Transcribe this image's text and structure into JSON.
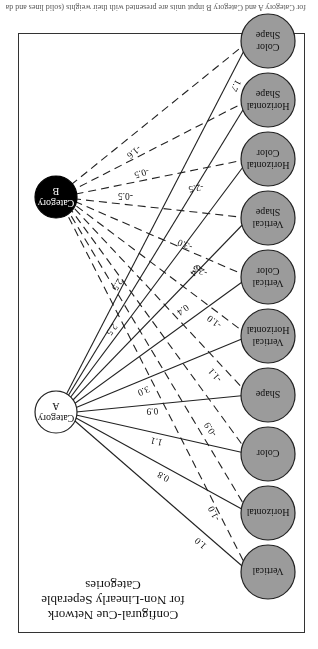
{
  "figure": {
    "title_lines": [
      "Configural-Cue Network",
      "for Non-Linearly Seperable",
      "Categories"
    ],
    "caption": "for Category A and Category B input units are presented with their weights (solid lines and dashed lines)",
    "orientation": "rotated 180 degrees",
    "colors": {
      "input_node_fill": "#9b9b9b",
      "category_a_fill": "#ffffff",
      "category_b_fill": "#000000",
      "line": "#222222"
    }
  },
  "input_nodes": [
    {
      "id": "vertical",
      "label_lines": [
        "Vertical"
      ]
    },
    {
      "id": "horizontal",
      "label_lines": [
        "Horizontal"
      ]
    },
    {
      "id": "color",
      "label_lines": [
        "Color"
      ]
    },
    {
      "id": "shape",
      "label_lines": [
        "Shape"
      ]
    },
    {
      "id": "vertical-horizontal",
      "label_lines": [
        "Vertical",
        "Horizontal"
      ]
    },
    {
      "id": "vertical-color",
      "label_lines": [
        "Vertical",
        "Color"
      ]
    },
    {
      "id": "vertical-shape",
      "label_lines": [
        "Vertical",
        "Shape"
      ]
    },
    {
      "id": "horizontal-color",
      "label_lines": [
        "Horizontal",
        "Color"
      ]
    },
    {
      "id": "horizontal-shape",
      "label_lines": [
        "Horizontal",
        "Shape"
      ]
    },
    {
      "id": "color-shape",
      "label_lines": [
        "Color",
        "Shape"
      ]
    }
  ],
  "output_nodes": [
    {
      "id": "category-a",
      "label_lines": [
        "Category",
        "A"
      ],
      "style": "white"
    },
    {
      "id": "category-b",
      "label_lines": [
        "Category",
        "B"
      ],
      "style": "black"
    }
  ],
  "weights_to_category_a": [
    "1.0",
    "0.8",
    "1.1",
    "0.9",
    "3.0",
    "0.4",
    "0.4",
    "2.5",
    "2.5",
    "1.7"
  ],
  "weights_to_category_b": [
    "-1.0",
    "",
    "-0.9",
    "-1.1",
    "-1.0",
    "-2.5",
    "-3.0",
    "-2.5",
    "-0.5",
    "-1.6"
  ],
  "extra_weight_labels_b": [
    "-0.5"
  ],
  "legend": {
    "solid_line": "connection to Category A",
    "dashed_line": "connection to Category B"
  }
}
